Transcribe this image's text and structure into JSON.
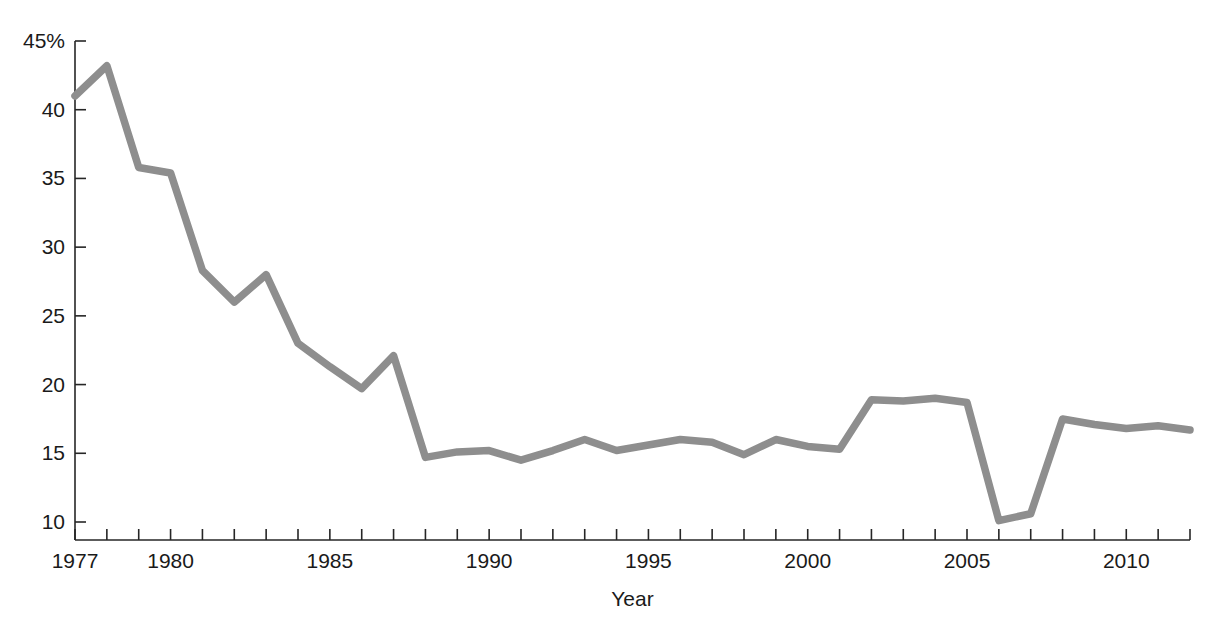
{
  "chart_data": {
    "type": "line",
    "title": "",
    "xlabel": "Year",
    "ylabel": "",
    "x": [
      1977,
      1978,
      1979,
      1980,
      1981,
      1982,
      1983,
      1984,
      1985,
      1986,
      1987,
      1988,
      1989,
      1990,
      1991,
      1992,
      1993,
      1994,
      1995,
      1996,
      1997,
      1998,
      1999,
      2000,
      2001,
      2002,
      2003,
      2004,
      2005,
      2006,
      2007,
      2008,
      2009,
      2010,
      2011,
      2012
    ],
    "values": [
      41.0,
      43.2,
      35.8,
      35.4,
      28.3,
      26.0,
      28.0,
      23.0,
      21.3,
      19.7,
      22.1,
      14.7,
      15.1,
      15.2,
      14.5,
      15.2,
      16.0,
      15.2,
      15.6,
      16.0,
      15.8,
      14.9,
      16.0,
      15.5,
      15.3,
      18.9,
      18.8,
      19.0,
      18.7,
      10.1,
      10.6,
      17.5,
      17.1,
      16.8,
      17.0,
      16.7
    ],
    "series": [
      {
        "name": "percent",
        "color": "#8e8e8e",
        "values": [
          41.0,
          43.2,
          35.8,
          35.4,
          28.3,
          26.0,
          28.0,
          23.0,
          21.3,
          19.7,
          22.1,
          14.7,
          15.1,
          15.2,
          14.5,
          15.2,
          16.0,
          15.2,
          15.6,
          16.0,
          15.8,
          14.9,
          16.0,
          15.5,
          15.3,
          18.9,
          18.8,
          19.0,
          18.7,
          10.1,
          10.6,
          17.5,
          17.1,
          16.8,
          17.0,
          16.7
        ]
      }
    ],
    "xlim": [
      1977,
      2012
    ],
    "ylim": [
      9.0,
      45.5
    ],
    "ytick_values": [
      45,
      40,
      35,
      30,
      25,
      20,
      15,
      10
    ],
    "ytick_labels": [
      "45%",
      "40",
      "35",
      "30",
      "25",
      "20",
      "15",
      "10"
    ],
    "xtick_values": [
      1977,
      1978,
      1979,
      1980,
      1981,
      1982,
      1983,
      1984,
      1985,
      1986,
      1987,
      1988,
      1989,
      1990,
      1991,
      1992,
      1993,
      1994,
      1995,
      1996,
      1997,
      1998,
      1999,
      2000,
      2001,
      2002,
      2003,
      2004,
      2005,
      2006,
      2007,
      2008,
      2009,
      2010,
      2011,
      2012
    ],
    "xtick_labeled": [
      1977,
      1980,
      1985,
      1990,
      1995,
      2000,
      2005,
      2010
    ],
    "xtick_labels": [
      "1977",
      "1980",
      "1985",
      "1990",
      "1995",
      "2000",
      "2005",
      "2010"
    ],
    "grid": false,
    "legend": "none",
    "line_color": "#8e8e8e",
    "axis_color": "#262626",
    "background": "#ffffff"
  },
  "axis": {
    "x_title": "Year",
    "y_title": ""
  },
  "caption": {
    "top_text": ""
  }
}
